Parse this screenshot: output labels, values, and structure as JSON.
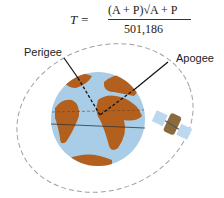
{
  "formula": {
    "lhs": "T =",
    "numerator": "(A + P)√A + P",
    "denominator": "501,186"
  },
  "labels": {
    "perigee": "Perigee",
    "apogee": "Apogee"
  },
  "colors": {
    "ocean": "#a9cde6",
    "land": "#b3601f",
    "orbit": "#999999",
    "solar_panel": "#bcd8ee",
    "satellite_body": "#8a6a3c"
  }
}
